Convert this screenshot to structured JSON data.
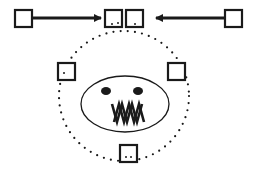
{
  "diagram": {
    "colors": {
      "ink": "#1a1a1a",
      "background": "#ffffff"
    },
    "nodes": [
      {
        "id": "outer-left",
        "label": "",
        "role": "source",
        "marked": false
      },
      {
        "id": "top-left-inner",
        "label": "",
        "role": "target",
        "marked": true
      },
      {
        "id": "top-right-inner",
        "label": "",
        "role": "target",
        "marked": true
      },
      {
        "id": "outer-right",
        "label": "",
        "role": "source",
        "marked": false
      },
      {
        "id": "circle-left",
        "label": "",
        "role": "orbit",
        "marked": true
      },
      {
        "id": "circle-right",
        "label": "",
        "role": "orbit",
        "marked": false
      },
      {
        "id": "circle-bottom",
        "label": "",
        "role": "orbit",
        "marked": true
      }
    ],
    "edges": [
      {
        "from": "outer-left",
        "to": "top-left-inner",
        "style": "solid-arrow"
      },
      {
        "from": "outer-right",
        "to": "top-right-inner",
        "style": "solid-arrow"
      }
    ],
    "orbit": {
      "style": "dotted-circle"
    },
    "face": {
      "eyes": 2,
      "mouth": "zigzag-teeth"
    }
  }
}
